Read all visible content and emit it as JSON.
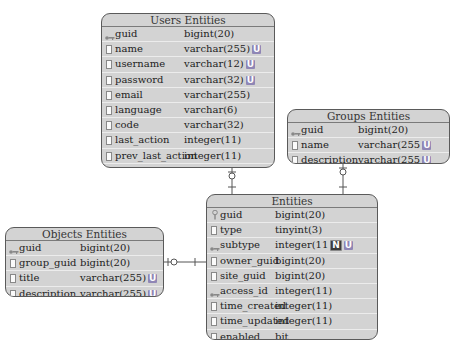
{
  "diagram": {
    "entities": {
      "users": {
        "title": "Users Entities",
        "columns": [
          {
            "name": "guid",
            "type": "bigint(20)",
            "icon": "key-icon",
            "badges": []
          },
          {
            "name": "name",
            "type": "varchar(255)",
            "icon": "column-icon",
            "badges": [
              "U"
            ]
          },
          {
            "name": "username",
            "type": "varchar(12)",
            "icon": "column-icon",
            "badges": [
              "U"
            ]
          },
          {
            "name": "password",
            "type": "varchar(32)",
            "icon": "column-icon",
            "badges": [
              "U"
            ]
          },
          {
            "name": "email",
            "type": "varchar(255)",
            "icon": "column-icon",
            "badges": []
          },
          {
            "name": "language",
            "type": "varchar(6)",
            "icon": "column-icon",
            "badges": []
          },
          {
            "name": "code",
            "type": "varchar(32)",
            "icon": "column-icon",
            "badges": []
          },
          {
            "name": "last_action",
            "type": "integer(11)",
            "icon": "column-icon",
            "badges": []
          },
          {
            "name": "prev_last_action",
            "type": "integer(11)",
            "icon": "column-icon",
            "badges": []
          },
          {
            "name": "last_login",
            "type": "integer(11)",
            "icon": "column-icon",
            "badges": []
          },
          {
            "name": "prev_last_login",
            "type": "integer(11)",
            "icon": "column-icon",
            "badges": []
          }
        ]
      },
      "groups": {
        "title": "Groups Entities",
        "columns": [
          {
            "name": "guid",
            "type": "bigint(20)",
            "icon": "key-icon",
            "badges": []
          },
          {
            "name": "name",
            "type": "varchar(255",
            "icon": "column-icon",
            "badges": [
              "U"
            ]
          },
          {
            "name": "description",
            "type": "varchar(255",
            "icon": "column-icon",
            "badges": [
              "U"
            ]
          }
        ]
      },
      "entities": {
        "title": "Entities",
        "columns": [
          {
            "name": "guid",
            "type": "bigint(20)",
            "icon": "primary-key-icon",
            "badges": []
          },
          {
            "name": "type",
            "type": "tinyint(3)",
            "icon": "column-icon",
            "badges": []
          },
          {
            "name": "subtype",
            "type": "integer(11",
            "icon": "key-icon",
            "badges": [
              "N",
              "U"
            ]
          },
          {
            "name": "owner_guid",
            "type": "bigint(20)",
            "icon": "column-icon",
            "badges": []
          },
          {
            "name": "site_guid",
            "type": "bigint(20)",
            "icon": "column-icon",
            "badges": []
          },
          {
            "name": "access_id",
            "type": "integer(11)",
            "icon": "key-icon",
            "badges": []
          },
          {
            "name": "time_created",
            "type": "integer(11)",
            "icon": "column-icon",
            "badges": []
          },
          {
            "name": "time_updated",
            "type": "integer(11)",
            "icon": "column-icon",
            "badges": []
          },
          {
            "name": "enabled",
            "type": "bit",
            "icon": "column-icon",
            "badges": []
          }
        ]
      },
      "objects": {
        "title": "Objects Entities",
        "columns": [
          {
            "name": "guid",
            "type": "bigint(20)",
            "icon": "key-icon",
            "badges": []
          },
          {
            "name": "group_guid",
            "type": "bigint(20)",
            "icon": "column-icon",
            "badges": []
          },
          {
            "name": "title",
            "type": "varchar(255)",
            "icon": "column-icon",
            "badges": [
              "U"
            ]
          },
          {
            "name": "description",
            "type": "varchar(255)",
            "icon": "column-icon",
            "badges": [
              "U"
            ]
          }
        ]
      }
    },
    "relationships": [
      {
        "from": "Users Entities",
        "to": "Entities",
        "notation": "one-and-only-one / zero-or-one"
      },
      {
        "from": "Groups Entities",
        "to": "Entities",
        "notation": "one-and-only-one / zero-or-one"
      },
      {
        "from": "Objects Entities",
        "to": "Entities",
        "notation": "one-and-only-one / zero-or-one"
      }
    ],
    "colors": {
      "table_fill": "#d3d3d3",
      "table_border": "#5a5a5a",
      "unique_badge": "#8f86b5",
      "null_badge": "#3c3c3c",
      "line": "#555555"
    }
  }
}
